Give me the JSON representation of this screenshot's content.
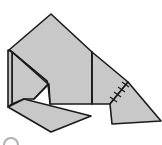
{
  "figure": {
    "fill_color": "#c8c8c8",
    "stroke_color": "#1a1a1a",
    "background_color": "#ffffff",
    "partial_marker_color": "#b0b0b0",
    "pieces": [
      {
        "name": "main-body",
        "points": "9,50 51,14 92,52 92,104 50,104 48,84 9,50"
      },
      {
        "name": "left-strip",
        "points": "9,50 12,52 12,104 9,107"
      },
      {
        "name": "left-inner-panel",
        "points": "12,52 46,80 48,84 34,99 24,99 12,104"
      },
      {
        "name": "right-flap",
        "points": "92,52 128,82 110,104 92,104"
      },
      {
        "name": "right-lower-flap",
        "points": "110,104 128,82 162,122 112,124"
      },
      {
        "name": "bottom-flap",
        "points": "9,107 24,99 91,116 51,132"
      }
    ],
    "hatch_count": 4
  }
}
